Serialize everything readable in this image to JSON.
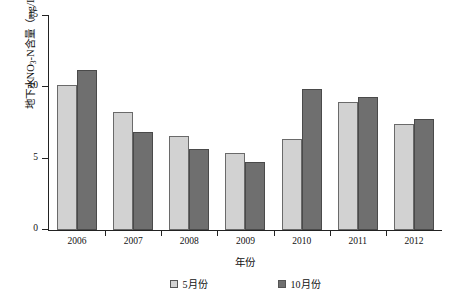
{
  "chart_data": {
    "type": "bar",
    "title": "",
    "xlabel": "年份",
    "ylabel": "地下水NO3-N含量（mg/L）",
    "ylabel_parts": {
      "prefix": "地下水NO",
      "subscript": "3",
      "suffix": "-N含量（mg/L）"
    },
    "categories": [
      "2006",
      "2007",
      "2008",
      "2009",
      "2010",
      "2011",
      "2012"
    ],
    "series": [
      {
        "name": "5月份",
        "color": "#d2d2d2",
        "values": [
          10.15,
          8.25,
          6.6,
          5.4,
          6.4,
          9.0,
          7.4
        ]
      },
      {
        "name": "10月份",
        "color": "#6f6f6f",
        "values": [
          11.2,
          6.9,
          5.7,
          4.8,
          9.9,
          9.35,
          7.75
        ]
      }
    ],
    "ylim": [
      0,
      15
    ],
    "yticks": [
      0,
      5,
      10,
      15
    ],
    "ytick_labels": [
      "0",
      "5",
      "10",
      "15"
    ],
    "grid": false,
    "legend_position": "bottom",
    "axis_color": "#222222",
    "background_color": "#ffffff"
  }
}
